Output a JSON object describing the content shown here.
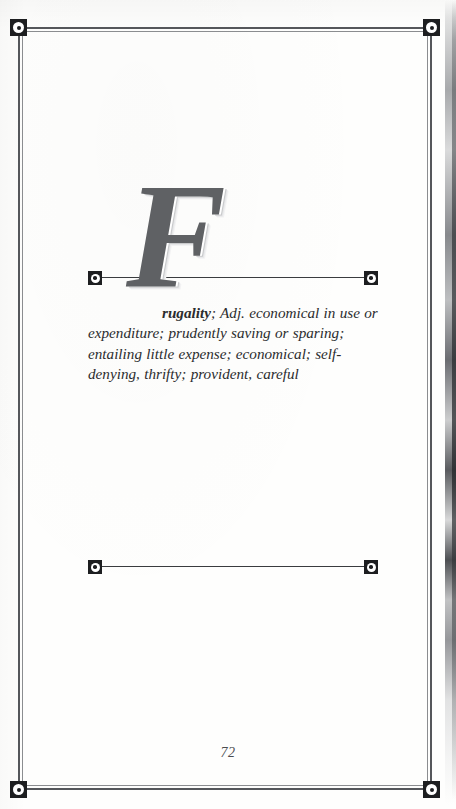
{
  "page": {
    "kind": "dictionary-entry-page",
    "number": "72",
    "background_color": "#fdfdfc",
    "ink_color": "#2b2c2e"
  },
  "frame": {
    "ornament_color": "#1d1e20",
    "rule_color": "#55575b",
    "corners": [
      {
        "name": "top-left",
        "glyph": "square-ring-dot"
      },
      {
        "name": "top-right",
        "glyph": "square-ring-dot"
      },
      {
        "name": "bottom-left",
        "glyph": "square-ring-dot"
      },
      {
        "name": "bottom-right",
        "glyph": "square-ring-dot"
      }
    ]
  },
  "entry": {
    "dropcap": "F",
    "dropcap_color": "#5f6164",
    "headword_remainder": "rugality",
    "definition_rest": "; Adj. economical in use or expenditure; prudently saving or sparing; entailing little expense; economical; self-denying, thrifty; provident, careful",
    "full_text": "Frugality; Adj. economical in use or expenditure; prudently saving or sparing; entailing little expense; economical; self-denying, thrifty; provident, careful",
    "dividers": {
      "top": {
        "end_glyph": "square-ring-dot",
        "line_color": "#3a3c3f"
      },
      "bottom": {
        "end_glyph": "square-ring-dot",
        "line_color": "#3a3c3f"
      }
    }
  }
}
